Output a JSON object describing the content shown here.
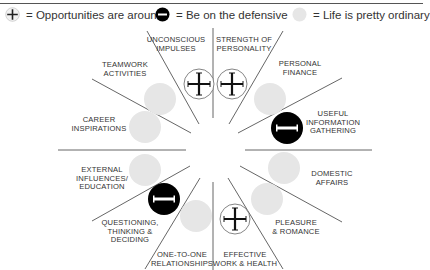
{
  "header": {
    "title": "YOUR MONTH AT A GLANCE"
  },
  "legend": {
    "items": [
      {
        "icon": "plus-circle-icon",
        "label": "= Opportunities are around"
      },
      {
        "icon": "minus-circle-icon",
        "label": "= Be on the defensive"
      },
      {
        "icon": "grey-circle-icon",
        "label": "= Life is pretty ordinary"
      }
    ]
  },
  "colors": {
    "line": "#555555",
    "neutral_circle": "#e6e6e6",
    "defensive_circle": "#000000",
    "opportunity_circle_border": "#555555",
    "text": "#333333"
  },
  "sectors": [
    {
      "id": "unconscious",
      "lines": [
        "UNCONSCIOUS",
        "IMPULSES"
      ],
      "status": "opportunity"
    },
    {
      "id": "strength",
      "lines": [
        "STRENGTH OF",
        "PERSONALITY"
      ],
      "status": "opportunity"
    },
    {
      "id": "finance",
      "lines": [
        "PERSONAL",
        "FINANCE"
      ],
      "status": "ordinary"
    },
    {
      "id": "information",
      "lines": [
        "USEFUL",
        "INFORMATION",
        "GATHERING"
      ],
      "status": "defensive"
    },
    {
      "id": "domestic",
      "lines": [
        "DOMESTIC",
        "AFFAIRS"
      ],
      "status": "ordinary"
    },
    {
      "id": "pleasure",
      "lines": [
        "PLEASURE",
        "& ROMANCE"
      ],
      "status": "ordinary"
    },
    {
      "id": "work",
      "lines": [
        "EFFECTIVE",
        "WORK & HEALTH"
      ],
      "status": "opportunity"
    },
    {
      "id": "relationships",
      "lines": [
        "ONE-TO-ONE",
        "RELATIONSHIPS"
      ],
      "status": "ordinary"
    },
    {
      "id": "questioning",
      "lines": [
        "QUESTIONING,",
        "THINKING &",
        "DECIDING"
      ],
      "status": "defensive"
    },
    {
      "id": "external",
      "lines": [
        "EXTERNAL",
        "INFLUENCES/",
        "EDUCATION"
      ],
      "status": "ordinary"
    },
    {
      "id": "career",
      "lines": [
        "CAREER",
        "INSPIRATIONS"
      ],
      "status": "ordinary"
    },
    {
      "id": "teamwork",
      "lines": [
        "TEAMWORK",
        "ACTIVITIES"
      ],
      "status": "ordinary"
    }
  ]
}
